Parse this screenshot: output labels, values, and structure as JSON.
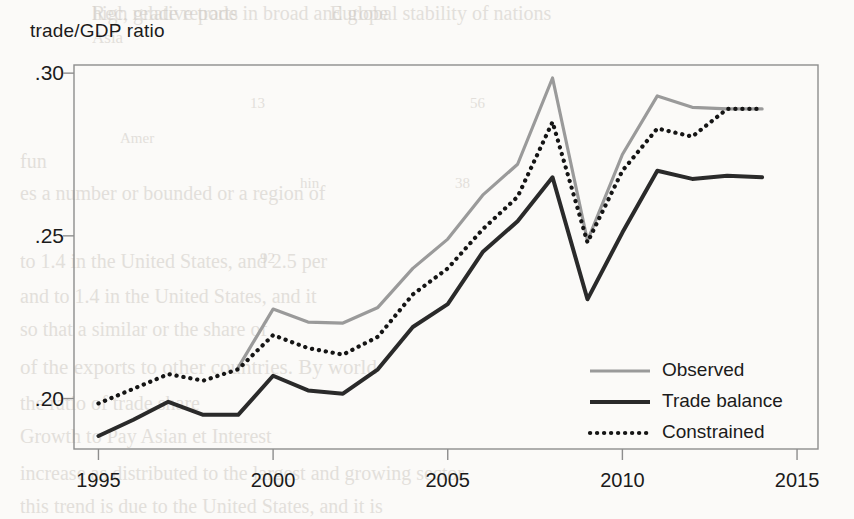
{
  "chart_data": {
    "type": "line",
    "title": "",
    "ylabel": "trade/GDP ratio",
    "xlabel": "",
    "xlim": [
      1994.3,
      2015.6
    ],
    "ylim": [
      0.1845,
      0.3025
    ],
    "grid": false,
    "legend_position": "inside-lower-right",
    "ytick_labels": [
      ".30",
      ".25",
      ".20"
    ],
    "ytick_values": [
      0.3,
      0.25,
      0.2
    ],
    "xtick_labels": [
      "1995",
      "2000",
      "2005",
      "2010",
      "2015"
    ],
    "xtick_values": [
      1995,
      2000,
      2005,
      2010,
      2015
    ],
    "x": [
      1995,
      1996,
      1997,
      1998,
      1999,
      2000,
      2001,
      2002,
      2003,
      2004,
      2005,
      2006,
      2007,
      2008,
      2009,
      2010,
      2011,
      2012,
      2013,
      2014
    ],
    "series": [
      {
        "name": "Observed",
        "style": "solid",
        "color": "#9a9a9a",
        "width": 3.2,
        "x": [
          1999,
          2000,
          2001,
          2002,
          2003,
          2004,
          2005,
          2006,
          2007,
          2008,
          2009,
          2010,
          2011,
          2012,
          2013,
          2014
        ],
        "values": [
          0.2095,
          0.2275,
          0.2235,
          0.2232,
          0.228,
          0.24,
          0.249,
          0.2625,
          0.272,
          0.2985,
          0.2485,
          0.275,
          0.293,
          0.2895,
          0.289,
          0.289
        ]
      },
      {
        "name": "Trade balance",
        "style": "solid",
        "color": "#2a2a2a",
        "width": 4.0,
        "x": [
          1995,
          1996,
          1997,
          1998,
          1999,
          2000,
          2001,
          2002,
          2003,
          2004,
          2005,
          2006,
          2007,
          2008,
          2009,
          2010,
          2011,
          2012,
          2013,
          2014
        ],
        "values": [
          0.1885,
          0.1935,
          0.199,
          0.195,
          0.195,
          0.207,
          0.2025,
          0.2015,
          0.209,
          0.222,
          0.229,
          0.245,
          0.2545,
          0.268,
          0.2305,
          0.251,
          0.27,
          0.2675,
          0.2685,
          0.268
        ]
      },
      {
        "name": "Constrained",
        "style": "dotted",
        "color": "#151515",
        "width": 4.2,
        "x": [
          1995,
          1996,
          1997,
          1998,
          1999,
          2000,
          2001,
          2002,
          2003,
          2004,
          2005,
          2006,
          2007,
          2008,
          2009,
          2010,
          2011,
          2012,
          2013,
          2014
        ],
        "values": [
          0.1985,
          0.203,
          0.2075,
          0.2055,
          0.209,
          0.2195,
          0.2155,
          0.2135,
          0.219,
          0.232,
          0.24,
          0.252,
          0.262,
          0.285,
          0.248,
          0.27,
          0.283,
          0.2805,
          0.289,
          0.289
        ]
      }
    ]
  },
  "legend": {
    "items": [
      {
        "label": "Observed"
      },
      {
        "label": "Trade balance"
      },
      {
        "label": "Constrained"
      }
    ]
  },
  "background_text": {
    "lines": [
      "Rec, grade reports",
      "Europe",
      "Asia",
      "Amer",
      "13",
      "56",
      "hin",
      "38",
      "92",
      "fun",
      "es a number or bounded or a region of",
      "to 1.4 in the United States, and 2.5 per",
      "and to 1.4 in the United States, and it",
      "so that a similar or the share of",
      "of the exports to other countries. By world",
      "the ratio of trade share",
      "Growth to Pay Asian et Interest",
      "increase as distributed to the largest and growing sector",
      "this trend is due to the United States, and it is",
      "high relative trade in broad and global stability of nations"
    ]
  }
}
